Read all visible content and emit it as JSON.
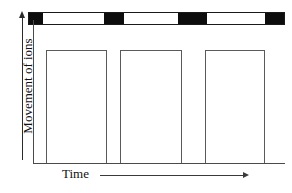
{
  "figure": {
    "type": "diagram"
  },
  "axes": {
    "y_label": "Movement of ions",
    "x_label": "Time",
    "y_arrow_icon": "up-arrow-icon",
    "x_arrow_icon": "right-arrow-icon",
    "grid": false,
    "tick_labels": []
  },
  "chart_data": {
    "type": "bar",
    "title": "",
    "xlabel": "Time",
    "ylabel": "Movement of ions",
    "categories": [
      "pulse-1",
      "pulse-2",
      "pulse-3"
    ],
    "values": [
      1,
      1,
      1
    ],
    "xlim": [
      0,
      252
    ],
    "ylim": [
      0,
      1
    ],
    "grid": false,
    "legend": "none",
    "pulses": [
      {
        "name": "pulse-1",
        "x_start": 13,
        "x_end": 74,
        "height": 113
      },
      {
        "name": "pulse-2",
        "x_start": 87,
        "x_end": 149,
        "height": 113
      },
      {
        "name": "pulse-3",
        "x_start": 172,
        "x_end": 232,
        "height": 113
      }
    ]
  },
  "stimulus_bar": {
    "name": "stimulus-bar",
    "fill_color": "#ffffff",
    "segment_color": "#0d0d0d",
    "border_color": "#1a1a1a",
    "segments": [
      {
        "name": "stimulus-segment-1",
        "left": 0,
        "width": 14
      },
      {
        "name": "stimulus-segment-2",
        "left": 75,
        "width": 20
      },
      {
        "name": "stimulus-segment-3",
        "left": 149,
        "width": 29
      },
      {
        "name": "stimulus-segment-4",
        "left": 236,
        "width": 19
      }
    ]
  },
  "colors": {
    "ink": "#111111",
    "axis": "#4a4a4a",
    "outline": "#5a5a5a",
    "black": "#0d0d0d",
    "background": "#ffffff"
  }
}
